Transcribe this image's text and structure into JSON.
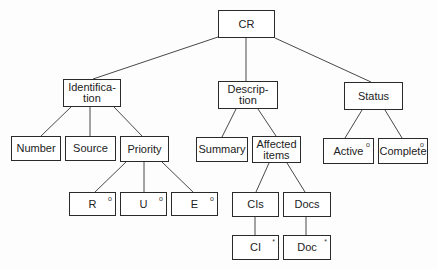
{
  "diagram": {
    "type": "tree",
    "root": "CR",
    "nodes": [
      {
        "id": "cr",
        "label": "CR",
        "x": 218,
        "y": 10,
        "w": 57,
        "h": 28,
        "mark": ""
      },
      {
        "id": "identification",
        "label": "Identifica-\ntion",
        "x": 63,
        "y": 79,
        "w": 58,
        "h": 28,
        "mark": ""
      },
      {
        "id": "description",
        "label": "Descrip-\ntion",
        "x": 218,
        "y": 81,
        "w": 60,
        "h": 28,
        "mark": ""
      },
      {
        "id": "status",
        "label": "Status",
        "x": 344,
        "y": 82,
        "w": 59,
        "h": 28,
        "mark": ""
      },
      {
        "id": "number",
        "label": "Number",
        "x": 11,
        "y": 136,
        "w": 50,
        "h": 25,
        "mark": ""
      },
      {
        "id": "source",
        "label": "Source",
        "x": 65,
        "y": 136,
        "w": 51,
        "h": 25,
        "mark": ""
      },
      {
        "id": "priority",
        "label": "Priority",
        "x": 120,
        "y": 136,
        "w": 49,
        "h": 26,
        "mark": ""
      },
      {
        "id": "summary",
        "label": "Summary",
        "x": 196,
        "y": 137,
        "w": 52,
        "h": 25,
        "mark": ""
      },
      {
        "id": "affected-items",
        "label": "Affected\nitems",
        "x": 252,
        "y": 136,
        "w": 49,
        "h": 27,
        "mark": ""
      },
      {
        "id": "active",
        "label": "Active",
        "x": 323,
        "y": 138,
        "w": 51,
        "h": 26,
        "mark": "o"
      },
      {
        "id": "complete",
        "label": "Complete",
        "x": 378,
        "y": 138,
        "w": 50,
        "h": 26,
        "mark": "o"
      },
      {
        "id": "r",
        "label": "R",
        "x": 69,
        "y": 192,
        "w": 47,
        "h": 24,
        "mark": "o"
      },
      {
        "id": "u",
        "label": "U",
        "x": 120,
        "y": 192,
        "w": 47,
        "h": 24,
        "mark": "o"
      },
      {
        "id": "e",
        "label": "E",
        "x": 171,
        "y": 192,
        "w": 47,
        "h": 24,
        "mark": "o"
      },
      {
        "id": "cis",
        "label": "CIs",
        "x": 232,
        "y": 192,
        "w": 47,
        "h": 25,
        "mark": ""
      },
      {
        "id": "docs",
        "label": "Docs",
        "x": 283,
        "y": 192,
        "w": 48,
        "h": 25,
        "mark": ""
      },
      {
        "id": "ci",
        "label": "CI",
        "x": 232,
        "y": 235,
        "w": 47,
        "h": 25,
        "mark": "*"
      },
      {
        "id": "doc",
        "label": "Doc",
        "x": 283,
        "y": 235,
        "w": 48,
        "h": 25,
        "mark": "*"
      }
    ],
    "edges": [
      {
        "from": "cr",
        "to": "identification",
        "x1": 218,
        "y1": 37,
        "x2": 93,
        "y2": 79
      },
      {
        "from": "cr",
        "to": "description",
        "x1": 246,
        "y1": 38,
        "x2": 246,
        "y2": 81
      },
      {
        "from": "cr",
        "to": "status",
        "x1": 275,
        "y1": 38,
        "x2": 371,
        "y2": 82
      },
      {
        "from": "identification",
        "to": "number",
        "x1": 71,
        "y1": 107,
        "x2": 41,
        "y2": 136
      },
      {
        "from": "identification",
        "to": "source",
        "x1": 90,
        "y1": 107,
        "x2": 90,
        "y2": 136
      },
      {
        "from": "identification",
        "to": "priority",
        "x1": 114,
        "y1": 107,
        "x2": 142,
        "y2": 136
      },
      {
        "from": "description",
        "to": "summary",
        "x1": 236,
        "y1": 109,
        "x2": 222,
        "y2": 137
      },
      {
        "from": "description",
        "to": "affected-items",
        "x1": 258,
        "y1": 109,
        "x2": 276,
        "y2": 136
      },
      {
        "from": "status",
        "to": "active",
        "x1": 362,
        "y1": 110,
        "x2": 345,
        "y2": 138
      },
      {
        "from": "status",
        "to": "complete",
        "x1": 385,
        "y1": 110,
        "x2": 402,
        "y2": 138
      },
      {
        "from": "priority",
        "to": "r",
        "x1": 126,
        "y1": 162,
        "x2": 95,
        "y2": 192
      },
      {
        "from": "priority",
        "to": "u",
        "x1": 144,
        "y1": 162,
        "x2": 144,
        "y2": 192
      },
      {
        "from": "priority",
        "to": "e",
        "x1": 162,
        "y1": 162,
        "x2": 193,
        "y2": 192
      },
      {
        "from": "affected-items",
        "to": "cis",
        "x1": 269,
        "y1": 163,
        "x2": 256,
        "y2": 192
      },
      {
        "from": "affected-items",
        "to": "docs",
        "x1": 287,
        "y1": 163,
        "x2": 305,
        "y2": 192
      },
      {
        "from": "cis",
        "to": "ci",
        "x1": 255,
        "y1": 217,
        "x2": 255,
        "y2": 235
      },
      {
        "from": "docs",
        "to": "doc",
        "x1": 306,
        "y1": 217,
        "x2": 306,
        "y2": 235
      }
    ],
    "legend_marks": {
      "o": "selection (one of)",
      "*": "iteration (zero or more)"
    }
  }
}
